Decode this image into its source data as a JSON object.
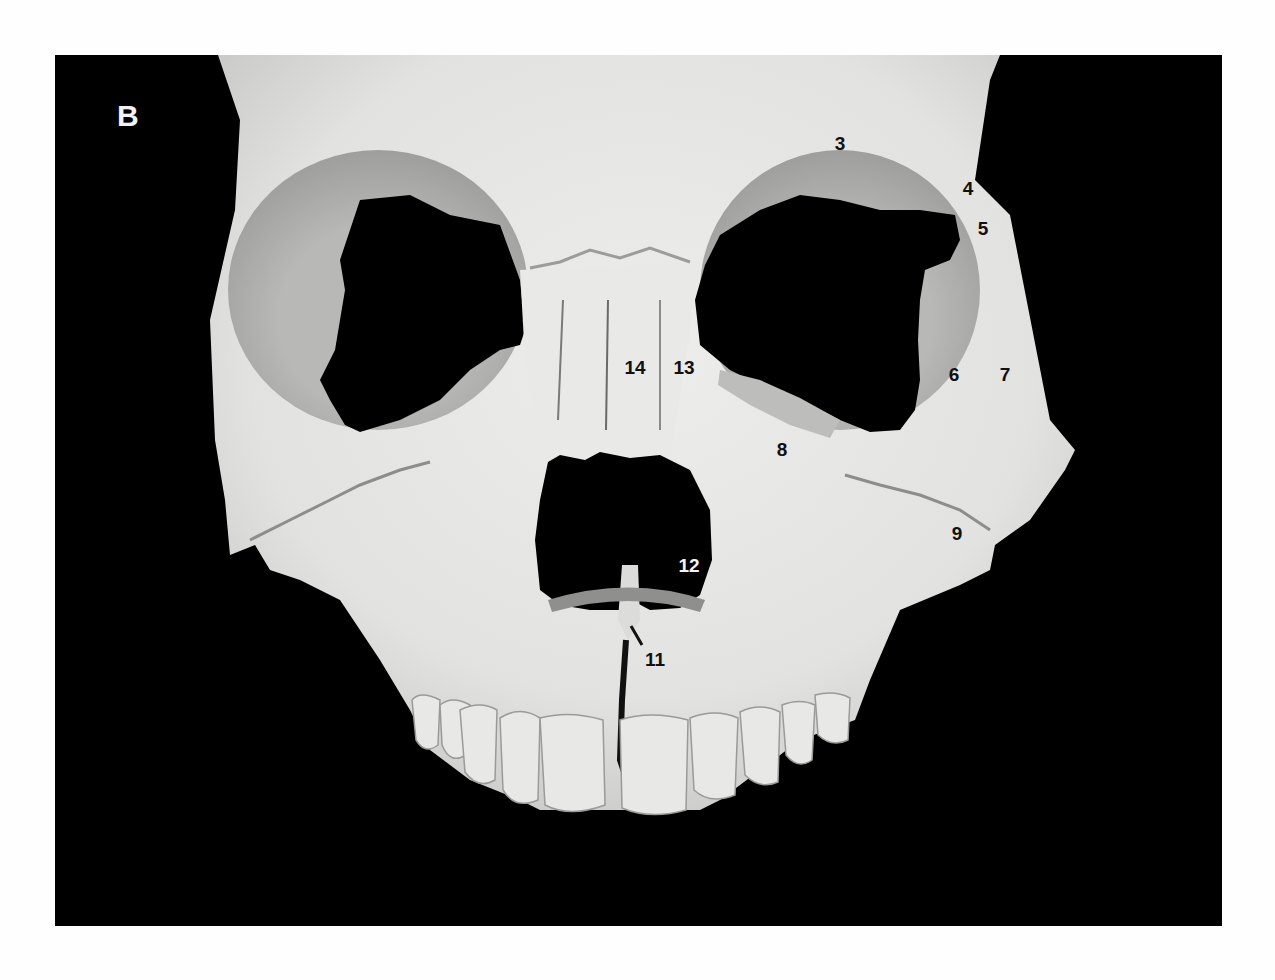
{
  "figure": {
    "panel_letter": "B",
    "colors": {
      "background": "#000000",
      "page": "#fefefe",
      "bone": "#e6e6e4",
      "bone_shadow": "#a9a9a7",
      "label_dark": "#111111",
      "label_light": "#f4f4f4"
    },
    "labels": [
      {
        "id": "3",
        "text": "3",
        "x": 840,
        "y": 143,
        "tone": "dark"
      },
      {
        "id": "4",
        "text": "4",
        "x": 968,
        "y": 188,
        "tone": "dark"
      },
      {
        "id": "5",
        "text": "5",
        "x": 983,
        "y": 228,
        "tone": "dark"
      },
      {
        "id": "6",
        "text": "6",
        "x": 954,
        "y": 374,
        "tone": "dark"
      },
      {
        "id": "7",
        "text": "7",
        "x": 1005,
        "y": 374,
        "tone": "dark"
      },
      {
        "id": "8",
        "text": "8",
        "x": 782,
        "y": 449,
        "tone": "dark"
      },
      {
        "id": "9",
        "text": "9",
        "x": 957,
        "y": 533,
        "tone": "dark"
      },
      {
        "id": "11",
        "text": "11",
        "x": 655,
        "y": 659,
        "tone": "dark"
      },
      {
        "id": "12",
        "text": "12",
        "x": 689,
        "y": 565,
        "tone": "light"
      },
      {
        "id": "13",
        "text": "13",
        "x": 684,
        "y": 367,
        "tone": "dark"
      },
      {
        "id": "14",
        "text": "14",
        "x": 635,
        "y": 367,
        "tone": "dark"
      }
    ],
    "leader_lines": [
      {
        "for": "11",
        "x1": 631,
        "y1": 626,
        "x2": 642,
        "y2": 645
      }
    ]
  }
}
